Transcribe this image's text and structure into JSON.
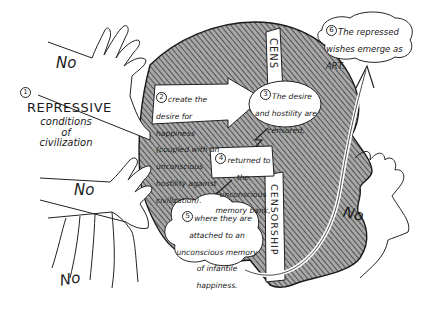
{
  "diagram": {
    "refusal_label": "No",
    "refusal_hands_count": 4,
    "steps": [
      {
        "number": "1",
        "title": "REPRESSIVE",
        "text": "conditions of civilization"
      },
      {
        "number": "2",
        "text": "create the desire for happiness (coupled with an unconscious hostility against civilization)."
      },
      {
        "number": "3",
        "text": "The desire and hostility are censored,"
      },
      {
        "number": "4",
        "text": "returned to the unconscious memory bank,"
      },
      {
        "number": "5",
        "text": "where they are attached to an unconscious memory of infantile happiness."
      },
      {
        "number": "6",
        "text": "The repressed wishes emerge as ART."
      }
    ],
    "censor_bar_top": "CENS",
    "censor_bar_bottom": "CENSORSHIP"
  },
  "colors": {
    "ink": "#1a1a1a",
    "hatch": "#555555",
    "head_fill": "#9a9a9a",
    "paper": "#ffffff"
  }
}
